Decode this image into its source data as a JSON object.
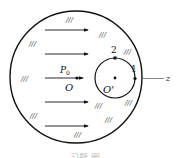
{
  "diagram": {
    "labels": {
      "p0": "P",
      "p0_sub": "0",
      "origin": "O",
      "origin_prime": "O'",
      "point1": "1",
      "point2": "2",
      "axis": "z"
    },
    "hatch_mark": "///",
    "caption": "习题 图",
    "colors": {
      "stroke": "#111111",
      "background": "#ffffff"
    },
    "arrows_count": 5
  }
}
